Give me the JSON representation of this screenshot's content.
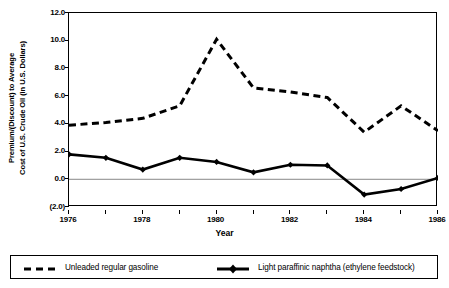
{
  "chart_data": {
    "type": "line",
    "title": "",
    "xlabel": "Year",
    "ylabel": "Premium/(Discount) to Average Cost of U.S. Crude Oil (in U.S. Dollars)",
    "ylabel_line1": "Premium/(Discount) to Average",
    "ylabel_line2": "Cost of U.S. Crude Oil (in U.S. Dollars)",
    "x": [
      1976,
      1977,
      1978,
      1979,
      1980,
      1981,
      1982,
      1983,
      1984,
      1985,
      1986
    ],
    "xlim": [
      1976,
      1986
    ],
    "ylim": [
      -2.0,
      12.0
    ],
    "yticks": [
      12.0,
      10.0,
      8.0,
      6.0,
      4.0,
      2.0,
      0.0,
      -2.0
    ],
    "ytick_labels": [
      "12.0",
      "10.0",
      "8.0",
      "6.0",
      "4.0",
      "2.0",
      "0.0",
      "(2.0)"
    ],
    "xticks": [
      1976,
      1977,
      1978,
      1979,
      1980,
      1981,
      1982,
      1983,
      1984,
      1985,
      1986
    ],
    "xtick_labels": [
      "1976",
      "",
      "1978",
      "",
      "1980",
      "",
      "1982",
      "",
      "1984",
      "",
      "1986"
    ],
    "xtick_labels_shown": [
      "1976",
      "1978",
      "1980",
      "1982",
      "1984",
      "1986"
    ],
    "grid": false,
    "zero_line": true,
    "legend_position": "below-plot",
    "series": [
      {
        "name": "Unleaded regular gasoline",
        "style": "dashed",
        "marker": "none",
        "color": "#000000",
        "values": [
          3.9,
          4.1,
          4.4,
          5.3,
          10.1,
          6.6,
          6.3,
          5.9,
          3.4,
          5.3,
          3.5
        ]
      },
      {
        "name": "Light paraffinic naphtha  (ethylene feedstock)",
        "style": "solid",
        "marker": "diamond",
        "color": "#000000",
        "values": [
          1.8,
          1.55,
          0.7,
          1.55,
          1.25,
          0.5,
          1.05,
          1.0,
          -1.1,
          -0.7,
          0.1
        ]
      }
    ]
  },
  "legend": {
    "entries": [
      {
        "label": "Unleaded regular gasoline"
      },
      {
        "label": "Light paraffinic naphtha  (ethylene feedstock)"
      }
    ]
  }
}
